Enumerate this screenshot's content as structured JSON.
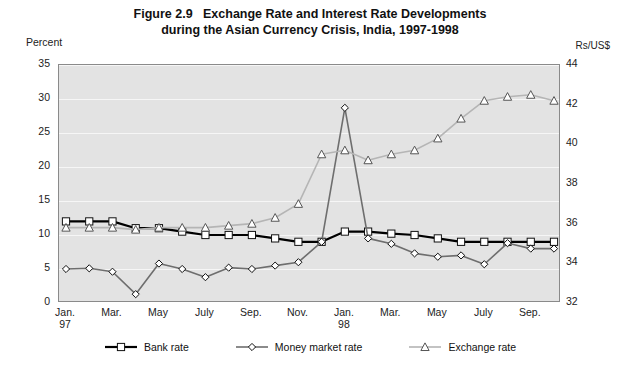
{
  "title": {
    "figure_number": "Figure 2.9",
    "line1": "Exchange Rate and Interest Rate Developments",
    "line2": "during the Asian Currency Crisis, India, 1997-1998"
  },
  "axis_captions": {
    "left": "Percent",
    "right": "Rs/US$"
  },
  "chart_data": {
    "type": "line",
    "xlabel": "",
    "ylabel": "Percent",
    "y2label": "Rs/US$",
    "ylim": [
      0,
      35
    ],
    "y2lim": [
      32,
      44
    ],
    "yticks": [
      0,
      5,
      10,
      15,
      20,
      25,
      30,
      35
    ],
    "y2ticks": [
      32,
      34,
      36,
      38,
      40,
      42,
      44
    ],
    "grid": true,
    "legend_position": "bottom",
    "x": [
      "Jan. 97",
      "Feb. 97",
      "Mar. 97",
      "Apr. 97",
      "May 97",
      "Jun. 97",
      "July 97",
      "Aug. 97",
      "Sep. 97",
      "Oct. 97",
      "Nov. 97",
      "Dec. 97",
      "Jan. 98",
      "Feb. 98",
      "Mar. 98",
      "Apr. 98",
      "May 98",
      "Jun. 98",
      "July 98",
      "Aug. 98",
      "Sep. 98",
      "Oct. 98"
    ],
    "xtick_labels": [
      {
        "label": "Jan.",
        "year": "97"
      },
      {
        "label": "Mar.",
        "year": ""
      },
      {
        "label": "May",
        "year": ""
      },
      {
        "label": "July",
        "year": ""
      },
      {
        "label": "Sep.",
        "year": ""
      },
      {
        "label": "Nov.",
        "year": ""
      },
      {
        "label": "Jan.",
        "year": "98"
      },
      {
        "label": "Mar.",
        "year": ""
      },
      {
        "label": "May",
        "year": ""
      },
      {
        "label": "July",
        "year": ""
      },
      {
        "label": "Sep.",
        "year": ""
      }
    ],
    "series": [
      {
        "name": "Bank rate",
        "axis": "left",
        "color": "#000000",
        "marker": "square",
        "values": [
          12.0,
          12.0,
          12.0,
          11.0,
          11.0,
          10.5,
          10.0,
          10.0,
          10.0,
          9.5,
          9.0,
          9.0,
          10.5,
          10.5,
          10.2,
          10.0,
          9.5,
          9.0,
          9.0,
          9.0,
          9.0,
          9.0
        ]
      },
      {
        "name": "Money market rate",
        "axis": "left",
        "color": "#6e6e6e",
        "marker": "diamond",
        "values": [
          5.0,
          5.1,
          4.6,
          1.3,
          5.8,
          5.0,
          3.8,
          5.2,
          5.0,
          5.5,
          6.0,
          9.0,
          28.7,
          9.5,
          8.7,
          7.3,
          6.8,
          7.0,
          5.7,
          8.8,
          8.0,
          8.0
        ]
      },
      {
        "name": "Exchange rate",
        "axis": "right",
        "color": "#b5b5b5",
        "marker": "triangle",
        "values": [
          35.8,
          35.8,
          35.8,
          35.7,
          35.8,
          35.8,
          35.8,
          35.9,
          36.0,
          36.3,
          37.0,
          39.5,
          39.7,
          39.2,
          39.5,
          39.7,
          40.3,
          41.3,
          42.2,
          42.4,
          42.5,
          42.2
        ]
      }
    ]
  },
  "legend": [
    {
      "label": "Bank rate",
      "marker": "square",
      "color": "#000000"
    },
    {
      "label": "Money market rate",
      "marker": "diamond",
      "color": "#6e6e6e"
    },
    {
      "label": "Exchange rate",
      "marker": "triangle",
      "color": "#b5b5b5"
    }
  ]
}
